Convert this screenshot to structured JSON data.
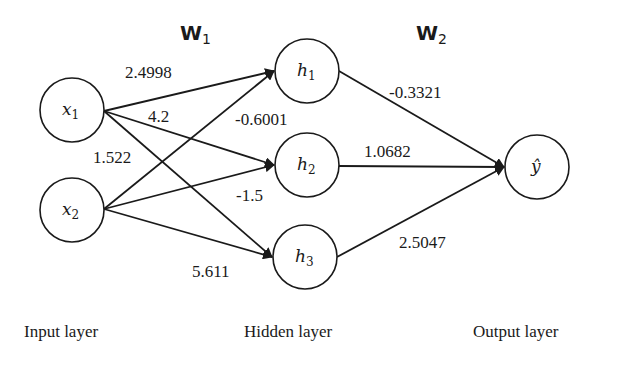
{
  "matrices": {
    "w1": {
      "symbol": "W",
      "subscript": "1"
    },
    "w2": {
      "symbol": "W",
      "subscript": "2"
    }
  },
  "nodes": {
    "x1": {
      "symbol": "x",
      "subscript": "1"
    },
    "x2": {
      "symbol": "x",
      "subscript": "2"
    },
    "h1": {
      "symbol": "h",
      "subscript": "1"
    },
    "h2": {
      "symbol": "h",
      "subscript": "2"
    },
    "h3": {
      "symbol": "h",
      "subscript": "3"
    },
    "y": {
      "symbol": "ŷ"
    }
  },
  "weights": {
    "x1_h1": "2.4998",
    "x1_h2": "4.2",
    "x1_h3": "1.522",
    "x2_h1": "-0.6001",
    "x2_h2": "-1.5",
    "x2_h3": "5.611",
    "h1_y": "-0.3321",
    "h2_y": "1.0682",
    "h3_y": "2.5047"
  },
  "layers": {
    "input": "Input layer",
    "hidden": "Hidden layer",
    "output": "Output layer"
  }
}
